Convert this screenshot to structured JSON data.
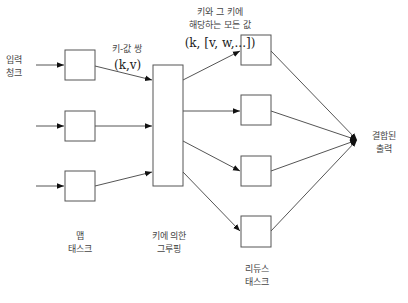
{
  "labels": {
    "input_chunk": [
      "입력",
      "청크"
    ],
    "kv_pair": "키-값 쌍",
    "kv_notation": "(k,v)",
    "all_values_line1": "키와 그 키에",
    "all_values_line2": "해당하는 모든 값",
    "all_values_notation": "(k, [v, w,...])",
    "map_task": [
      "맵",
      "태스크"
    ],
    "grouping": [
      "키에 의한",
      "그루핑"
    ],
    "reduce_task": [
      "리듀스",
      "태스크"
    ],
    "combined_output": [
      "결합된",
      "출력"
    ]
  },
  "diagram": {
    "map_boxes": 3,
    "reduce_boxes": 4,
    "stroke_color": "#555555"
  }
}
